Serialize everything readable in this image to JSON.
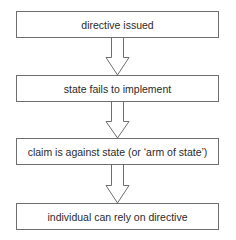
{
  "diagram": {
    "type": "flowchart",
    "direction": "top-to-bottom",
    "steps": [
      {
        "label": "directive issued"
      },
      {
        "label": "state fails to implement"
      },
      {
        "label": "claim is against state (or ‘arm of state’)"
      },
      {
        "label": "individual can rely on directive"
      }
    ],
    "connectors": [
      {
        "from": 0,
        "to": 1,
        "style": "hollow-block-arrow"
      },
      {
        "from": 1,
        "to": 2,
        "style": "hollow-block-arrow"
      },
      {
        "from": 2,
        "to": 3,
        "style": "hollow-block-arrow"
      }
    ],
    "colors": {
      "border": "#6e6e6e",
      "text": "#2a2a2a",
      "background": "#ffffff"
    }
  }
}
